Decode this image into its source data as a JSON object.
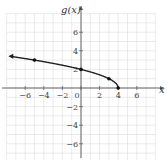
{
  "chart_data": {
    "type": "line",
    "title": "",
    "xlabel": "x",
    "ylabel": "g(x)",
    "xlim": [
      -8,
      8
    ],
    "ylim": [
      -8,
      8
    ],
    "grid": true,
    "x_ticks": [
      -6,
      -4,
      -2,
      0,
      2,
      4,
      6
    ],
    "y_ticks": [
      -6,
      -4,
      -2,
      2,
      4,
      6
    ],
    "series": [
      {
        "name": "g(x)",
        "function": "sqrt(4 - x)",
        "marked_points": [
          [
            -5,
            3
          ],
          [
            0,
            2
          ],
          [
            3,
            1
          ],
          [
            4,
            0
          ]
        ],
        "x": [
          -7.5,
          -5,
          -3,
          -1,
          0,
          1,
          2,
          3,
          3.5,
          4
        ],
        "y": [
          3.39,
          3,
          2.65,
          2.24,
          2,
          1.73,
          1.41,
          1,
          0.71,
          0
        ],
        "arrow_left": true
      }
    ]
  }
}
